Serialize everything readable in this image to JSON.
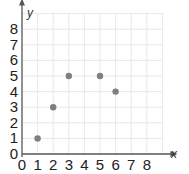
{
  "chart_data": {
    "type": "scatter",
    "title": "",
    "xlabel": "x",
    "ylabel": "y",
    "xlim": [
      0,
      9
    ],
    "ylim": [
      0,
      9
    ],
    "grid": true,
    "x_ticks": [
      0,
      1,
      2,
      3,
      4,
      5,
      6,
      7,
      8
    ],
    "y_ticks": [
      0,
      1,
      2,
      3,
      4,
      5,
      6,
      7,
      8
    ],
    "points": [
      {
        "x": 1,
        "y": 1
      },
      {
        "x": 2,
        "y": 3
      },
      {
        "x": 3,
        "y": 5
      },
      {
        "x": 5,
        "y": 5
      },
      {
        "x": 6,
        "y": 4
      }
    ],
    "point_color": "#7f7f7f",
    "axis_color": "#555555",
    "grid_color": "#e8e8e8"
  }
}
